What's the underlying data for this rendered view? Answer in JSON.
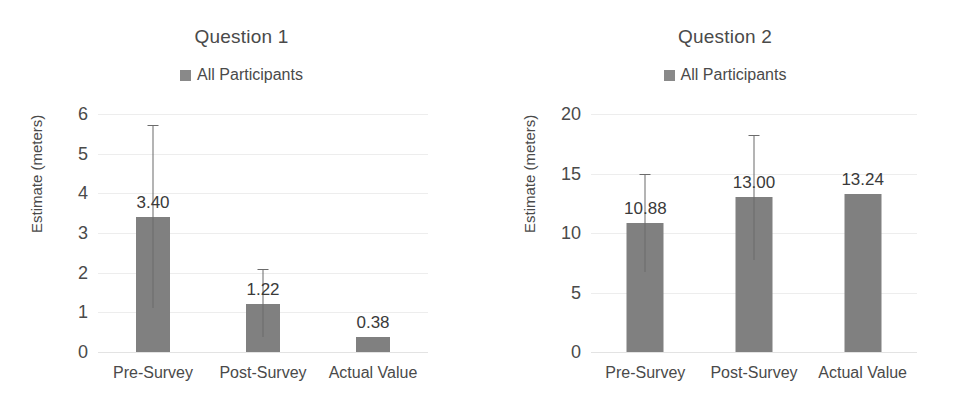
{
  "chart_data": [
    {
      "type": "bar",
      "title": "Question 1",
      "xlabel": "",
      "ylabel": "Estimate (meters)",
      "categories": [
        "Pre-Survey",
        "Post-Survey",
        "Actual Value"
      ],
      "values": [
        3.4,
        1.22,
        0.38
      ],
      "value_labels": [
        "3.40",
        "1.22",
        "0.38"
      ],
      "error_bars": [
        {
          "low": 1.1,
          "high": 5.72
        },
        {
          "low": 0.38,
          "high": 2.1
        },
        null
      ],
      "ylim": [
        0,
        6
      ],
      "yticks": [
        0,
        1,
        2,
        3,
        4,
        5,
        6
      ],
      "ytick_labels": [
        "0",
        "1",
        "2",
        "3",
        "4",
        "5",
        "6"
      ],
      "grid": true,
      "legend": [
        "All Participants"
      ],
      "legend_position": "top",
      "series_color": "#808080"
    },
    {
      "type": "bar",
      "title": "Question 2",
      "xlabel": "",
      "ylabel": "Estimate (meters)",
      "categories": [
        "Pre-Survey",
        "Post-Survey",
        "Actual Value"
      ],
      "values": [
        10.88,
        13.0,
        13.24
      ],
      "value_labels": [
        "10.88",
        "13.00",
        "13.24"
      ],
      "error_bars": [
        {
          "low": 6.75,
          "high": 15.0
        },
        {
          "low": 7.7,
          "high": 18.2
        },
        null
      ],
      "ylim": [
        0,
        20
      ],
      "yticks": [
        0,
        5,
        10,
        15,
        20
      ],
      "ytick_labels": [
        "0",
        "5",
        "10",
        "15",
        "20"
      ],
      "grid": true,
      "legend": [
        "All Participants"
      ],
      "legend_position": "top",
      "series_color": "#808080"
    }
  ],
  "colors": {
    "bar": "#808080",
    "legend_swatch": "#898989",
    "gridline": "#ededed",
    "text": "#4a4a4a",
    "error_bar": "#6b6b6b",
    "background": "#ffffff"
  }
}
